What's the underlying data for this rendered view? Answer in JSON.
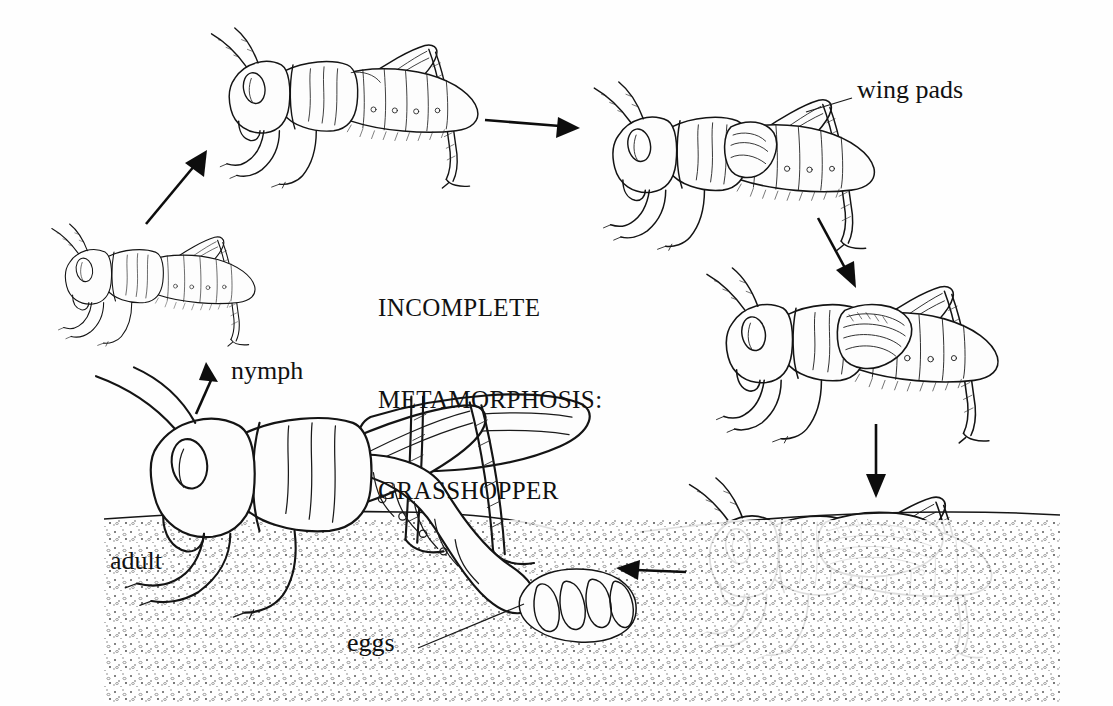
{
  "figure": {
    "kind": "scientific-illustration",
    "background_color": "#fefefe",
    "ink_color": "#141414",
    "title_lines": [
      "INCOMPLETE",
      "METAMORPHOSIS:",
      "GRASSHOPPER"
    ],
    "title_text": "INCOMPLETE METAMORPHOSIS: GRASSHOPPER"
  },
  "labels": {
    "wing_pads": "wing pads",
    "nymph": "nymph",
    "adult": "adult",
    "eggs": "eggs"
  },
  "stages": [
    {
      "id": "stage-1-early-nymph",
      "name": "early instar nymph",
      "position": "left-middle",
      "wings": "none",
      "facing": "left"
    },
    {
      "id": "stage-2-nymph",
      "name": "second instar nymph",
      "position": "top-left",
      "wings": "none",
      "facing": "left"
    },
    {
      "id": "stage-3-nymph-wing-pads",
      "name": "nymph with wing pads",
      "position": "top-right",
      "wings": "wing pads",
      "facing": "left"
    },
    {
      "id": "stage-4-nymph-larger-pads",
      "name": "late instar nymph",
      "position": "right-middle",
      "wings": "enlarged wing pads",
      "facing": "left"
    },
    {
      "id": "stage-5-subadult",
      "name": "final instar nymph",
      "position": "right-bottom",
      "wings": "developing wings",
      "facing": "left"
    },
    {
      "id": "stage-6-adult",
      "name": "adult laying eggs",
      "position": "bottom-left",
      "wings": "full wings",
      "facing": "left"
    }
  ],
  "cycle_arrows": [
    {
      "id": "arrow-eggs-to-nymph",
      "from": "adult egg mass",
      "to": "early nymph",
      "direction": "up-right"
    },
    {
      "id": "arrow-nymph-to-stage2",
      "from": "early nymph",
      "to": "second instar",
      "direction": "up-right"
    },
    {
      "id": "arrow-stage2-to-stage3",
      "from": "second instar",
      "to": "wing pad nymph",
      "direction": "right"
    },
    {
      "id": "arrow-stage3-to-stage4",
      "from": "wing pad nymph",
      "to": "late instar",
      "direction": "down-right"
    },
    {
      "id": "arrow-stage4-to-stage5",
      "from": "late instar",
      "to": "final instar",
      "direction": "down"
    },
    {
      "id": "arrow-stage5-to-adult",
      "from": "final instar",
      "to": "adult",
      "direction": "left"
    }
  ],
  "leaders": [
    {
      "id": "leader-eggs",
      "label": "eggs",
      "points_to": "egg mass in soil"
    },
    {
      "id": "leader-wing-pads",
      "label": "wing pads",
      "points_to": "thoracic wing pads"
    }
  ]
}
